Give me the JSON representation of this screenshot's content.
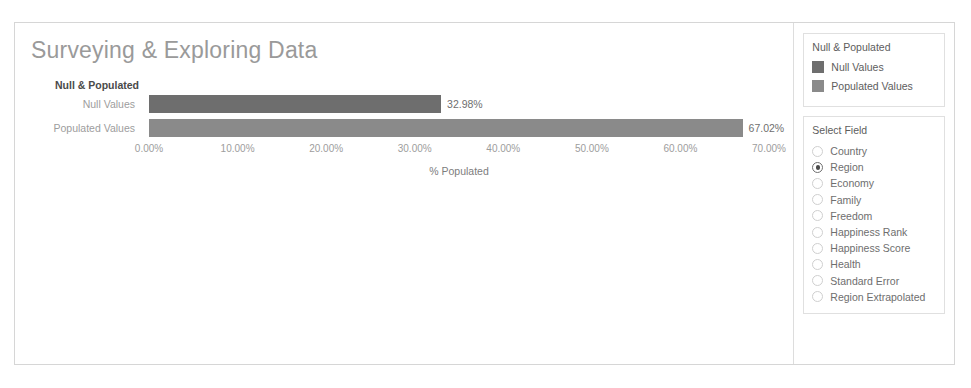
{
  "page_title": "Surveying & Exploring Data",
  "chart_data": {
    "type": "bar",
    "orientation": "horizontal",
    "title": "Null & Populated",
    "categories": [
      "Null Values",
      "Populated Values"
    ],
    "values": [
      32.98,
      67.02
    ],
    "value_labels": [
      "32.98%",
      "67.02%"
    ],
    "xlabel": "% Populated",
    "ylabel": "",
    "xlim": [
      0,
      70
    ],
    "xticks": [
      0,
      10,
      20,
      30,
      40,
      50,
      60,
      70
    ],
    "xtick_labels": [
      "0.00%",
      "10.00%",
      "20.00%",
      "30.00%",
      "40.00%",
      "50.00%",
      "60.00%",
      "70.00%"
    ],
    "grid": false,
    "legend_position": "right",
    "colors": [
      "#6e6e6e",
      "#8a8a8a"
    ]
  },
  "legend_panel": {
    "title": "Null & Populated",
    "items": [
      {
        "label": "Null Values",
        "color": "#6e6e6e"
      },
      {
        "label": "Populated Values",
        "color": "#8a8a8a"
      }
    ]
  },
  "select_field_panel": {
    "title": "Select Field",
    "selected": "Region",
    "options": [
      {
        "label": "Country",
        "selected": false
      },
      {
        "label": "Region",
        "selected": true
      },
      {
        "label": "Economy",
        "selected": false
      },
      {
        "label": "Family",
        "selected": false
      },
      {
        "label": "Freedom",
        "selected": false
      },
      {
        "label": "Happiness Rank",
        "selected": false
      },
      {
        "label": "Happiness Score",
        "selected": false
      },
      {
        "label": "Health",
        "selected": false
      },
      {
        "label": "Standard Error",
        "selected": false
      },
      {
        "label": "Region Extrapolated",
        "selected": false
      }
    ]
  }
}
